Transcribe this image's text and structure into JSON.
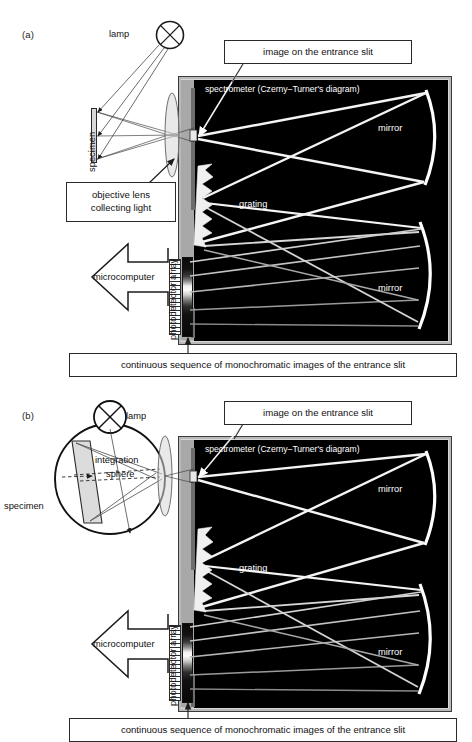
{
  "figure": {
    "panels": [
      {
        "id": "a",
        "letter": "(a)",
        "labels": {
          "lamp": "lamp",
          "specimen": "specimen",
          "objective": {
            "line1": "objective lens",
            "line2": "collecting light"
          },
          "microcomputer": "microcomputer",
          "photodetector": "photodetector array",
          "entrance_slit": "image on the entrance slit",
          "spectrometer": "spectrometer (Czerny–Turner's diagram)",
          "grating": "grating",
          "mirror_top": "mirror",
          "mirror_bottom": "mirror",
          "caption": "continuous sequence of monochromatic images of the entrance slit"
        }
      },
      {
        "id": "b",
        "letter": "(b)",
        "labels": {
          "lamp": "lamp",
          "specimen": "specimen",
          "integration_sphere": {
            "line1": "integration",
            "line2": "sphere"
          },
          "microcomputer": "microcomputer",
          "photodetector": "photodetector array",
          "entrance_slit": "image on the entrance slit",
          "spectrometer": "spectrometer (Czerny–Turner's diagram)",
          "grating": "grating",
          "mirror_top": "mirror",
          "mirror_bottom": "mirror",
          "caption": "continuous sequence of monochromatic images of the entrance slit"
        }
      }
    ],
    "colors": {
      "enclosure_fill": "#000000",
      "enclosure_border": "#b9b9b9",
      "bench_gray": "#a8a8a8",
      "ray_light": "#f2f2f2",
      "ray_dim": "#8a8a8a",
      "ink": "#111111",
      "paper": "#ffffff"
    }
  }
}
